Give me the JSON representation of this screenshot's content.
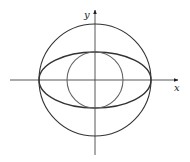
{
  "diagram": {
    "axes": {
      "x_label": "x",
      "y_label": "y",
      "origin": [
        95,
        80
      ],
      "x_range": [
        10,
        178
      ],
      "y_range": [
        10,
        155
      ]
    },
    "shapes": [
      {
        "type": "circle",
        "name": "outer-circle",
        "cx": 95,
        "cy": 80,
        "r": 56
      },
      {
        "type": "ellipse",
        "name": "ellipse",
        "cx": 95,
        "cy": 80,
        "rx": 56,
        "ry": 28
      },
      {
        "type": "circle",
        "name": "inner-circle",
        "cx": 95,
        "cy": 80,
        "r": 28
      }
    ],
    "stroke_color": "#333333"
  }
}
